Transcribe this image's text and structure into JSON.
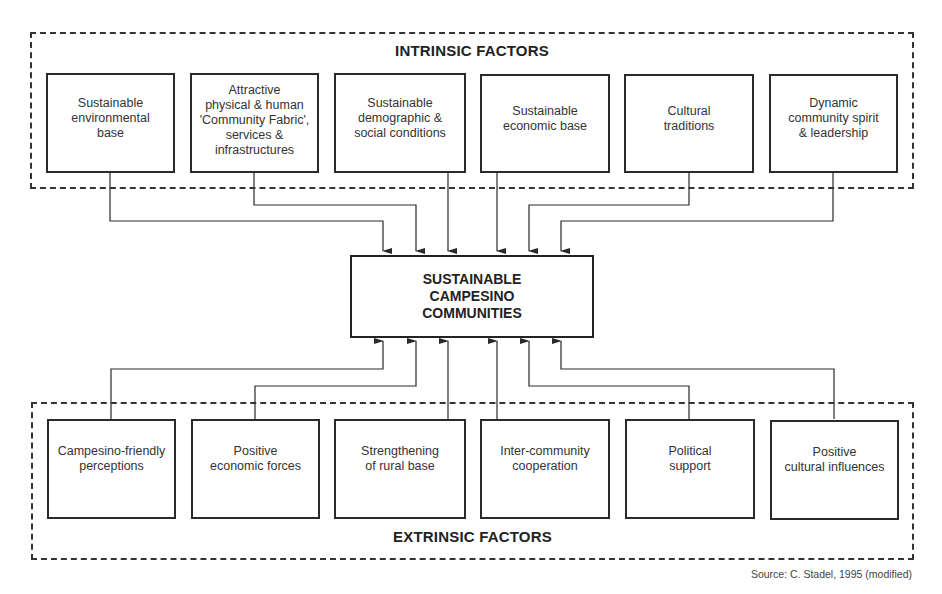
{
  "diagram": {
    "center": {
      "label": "SUSTAINABLE\nCAMPESINO\nCOMMUNITIES"
    },
    "intrinsic": {
      "title": "INTRINSIC FACTORS",
      "factors": [
        {
          "label": "Sustainable\nenvironmental\nbase"
        },
        {
          "label": "Attractive\nphysical & human\n'Community Fabric',\nservices &\ninfrastructures"
        },
        {
          "label": "Sustainable\ndemographic &\nsocial conditions"
        },
        {
          "label": "Sustainable\neconomic base"
        },
        {
          "label": "Cultural\ntraditions"
        },
        {
          "label": "Dynamic\ncommunity spirit\n& leadership"
        }
      ]
    },
    "extrinsic": {
      "title": "EXTRINSIC FACTORS",
      "factors": [
        {
          "label": "Campesino-friendly\nperceptions"
        },
        {
          "label": "Positive\neconomic forces"
        },
        {
          "label": "Strengthening\nof rural base"
        },
        {
          "label": "Inter-community\ncooperation"
        },
        {
          "label": "Political\nsupport"
        },
        {
          "label": "Positive\ncultural influences"
        }
      ]
    },
    "source": "Source: C. Stadel, 1995 (modified)",
    "colors": {
      "line": "#2a2a2a",
      "text": "#333333",
      "background": "#ffffff"
    }
  }
}
